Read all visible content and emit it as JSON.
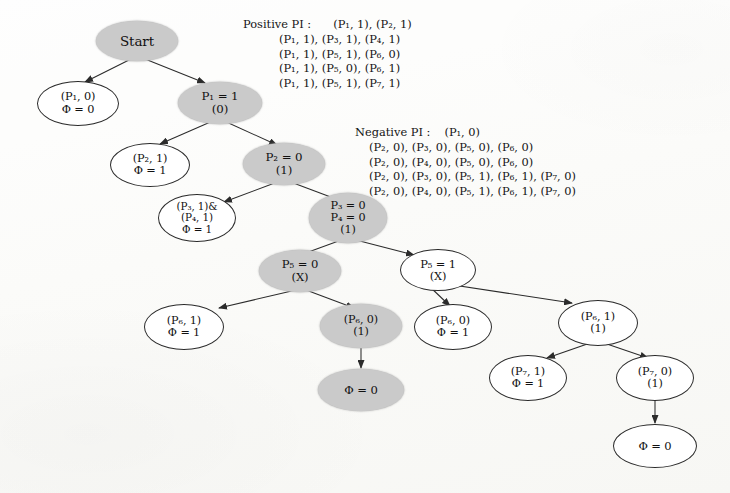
{
  "figure": {
    "type": "decision-tree",
    "node_fill_grey": "#cacaca",
    "node_fill_white": "#ffffff",
    "edge_color": "#2b2b2b"
  },
  "positive_pi": {
    "title": "Positive PI :",
    "rows": [
      "(P₁, 1), (P₂, 1)",
      "(P₁, 1), (P₃, 1), (P₄, 1)",
      "(P₁, 1), (P₅, 1), (P₆, 0)",
      "(P₁, 1), (P₅, 0), (P₆, 1)",
      "(P₁, 1), (P₅, 1), (P₇, 1)"
    ]
  },
  "negative_pi": {
    "title": "Negative PI :",
    "rows": [
      "(P₁, 0)",
      "(P₂, 0), (P₃, 0), (P₅, 0), (P₆, 0)",
      "(P₂, 0), (P₄, 0), (P₅, 0), (P₆, 0)",
      "(P₂, 0), (P₃, 0), (P₅, 1), (P₆, 1), (P₇, 0)",
      "(P₂, 0), (P₄, 0), (P₅, 1), (P₆, 1), (P₇, 0)"
    ]
  },
  "nodes": {
    "start": {
      "lines": [
        "Start"
      ],
      "fill": "grey"
    },
    "p1_false": {
      "lines": [
        "(P₁, 0)",
        "Φ = 0"
      ],
      "fill": "white"
    },
    "p1_true": {
      "lines": [
        "P₁ = 1",
        "(0)"
      ],
      "fill": "grey"
    },
    "p2_leaf": {
      "lines": [
        "(P₂, 1)",
        "Φ = 1"
      ],
      "fill": "white"
    },
    "p2_node": {
      "lines": [
        "P₂ = 0",
        "(1)"
      ],
      "fill": "grey"
    },
    "p34_leaf": {
      "lines": [
        "(P₃, 1)&",
        "(P₄, 1)",
        "Φ = 1"
      ],
      "fill": "white"
    },
    "p34_node": {
      "lines": [
        "P₃ = 0",
        "P₄ = 0",
        "(1)"
      ],
      "fill": "grey"
    },
    "p5_zero": {
      "lines": [
        "P₅ = 0",
        "(X)"
      ],
      "fill": "grey"
    },
    "p5_one": {
      "lines": [
        "P₅ = 1",
        "(X)"
      ],
      "fill": "white"
    },
    "p6_one_left": {
      "lines": [
        "(P₆, 1)",
        "Φ = 1"
      ],
      "fill": "white"
    },
    "p6_zero_grey": {
      "lines": [
        "(P₆, 0)",
        "(1)"
      ],
      "fill": "grey"
    },
    "phi_zero_mid": {
      "lines": [
        "Φ = 0"
      ],
      "fill": "grey"
    },
    "p6_zero_leaf": {
      "lines": [
        "(P₆, 0)",
        "Φ = 1"
      ],
      "fill": "white"
    },
    "p6_one_right": {
      "lines": [
        "(P₆, 1)",
        "(1)"
      ],
      "fill": "white"
    },
    "p7_one_leaf": {
      "lines": [
        "(P₇, 1)",
        "Φ = 1"
      ],
      "fill": "white"
    },
    "p7_zero_node": {
      "lines": [
        "(P₇, 0)",
        "(1)"
      ],
      "fill": "white"
    },
    "phi_zero_end": {
      "lines": [
        "Φ = 0"
      ],
      "fill": "white"
    }
  }
}
